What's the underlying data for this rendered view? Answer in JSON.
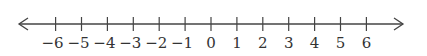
{
  "number_line": {
    "min": -6,
    "max": 6,
    "step": 1,
    "arrows": "both",
    "ticks": [
      {
        "value": -6,
        "label": "−6"
      },
      {
        "value": -5,
        "label": "−5"
      },
      {
        "value": -4,
        "label": "−4"
      },
      {
        "value": -3,
        "label": "−3"
      },
      {
        "value": -2,
        "label": "−2"
      },
      {
        "value": -1,
        "label": "−1"
      },
      {
        "value": 0,
        "label": "0"
      },
      {
        "value": 1,
        "label": "1"
      },
      {
        "value": 2,
        "label": "2"
      },
      {
        "value": 3,
        "label": "3"
      },
      {
        "value": 4,
        "label": "4"
      },
      {
        "value": 5,
        "label": "5"
      },
      {
        "value": 6,
        "label": "6"
      }
    ],
    "line_color": "#444444",
    "label_color": "#333333"
  }
}
